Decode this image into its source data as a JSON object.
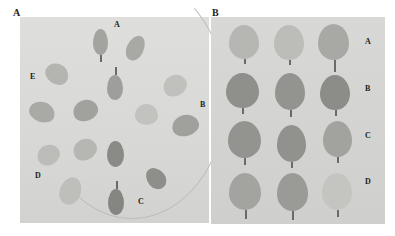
{
  "figure": {
    "panels": [
      {
        "label": "A",
        "group_labels": [
          "A",
          "B",
          "C",
          "D",
          "E"
        ]
      },
      {
        "label": "B",
        "row_labels": [
          "A",
          "B",
          "C",
          "D"
        ]
      }
    ]
  },
  "colors": {
    "background": "#ffffff",
    "panel_bg": "#d8d8d6",
    "leaf_light": "#b8b8b4",
    "leaf_mid": "#9a9a96",
    "leaf_dark": "#7e7e7a"
  }
}
